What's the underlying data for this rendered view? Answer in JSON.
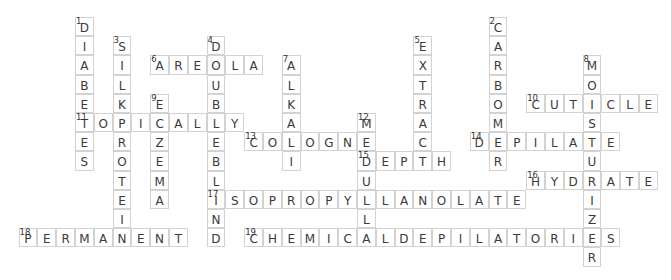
{
  "puzzle": {
    "grid": {
      "origin_x": 75,
      "origin_y": 17,
      "cell_w": 18.8,
      "cell_h": 19.2,
      "line_color": "#d2d2d2",
      "text_color": "#3a3a3a"
    },
    "words": [
      {
        "number": 1,
        "answer": "DIABETES",
        "direction": "down",
        "col": 0,
        "row": 0
      },
      {
        "number": 2,
        "answer": "CARBOMER",
        "direction": "down",
        "col": 22,
        "row": 0
      },
      {
        "number": 3,
        "answer": "SILKPROTEIN",
        "direction": "down",
        "col": 2,
        "row": 1
      },
      {
        "number": 4,
        "answer": "DOUBLEBLIND",
        "direction": "down",
        "col": 7,
        "row": 1
      },
      {
        "number": 5,
        "answer": "EXTRACT",
        "direction": "down",
        "col": 18,
        "row": 1
      },
      {
        "number": 6,
        "answer": "AREOLA",
        "direction": "across",
        "col": 4,
        "row": 2
      },
      {
        "number": 7,
        "answer": "ALKALI",
        "direction": "down",
        "col": 11,
        "row": 2
      },
      {
        "number": 8,
        "answer": "MOISTURIZER",
        "direction": "down",
        "col": 27,
        "row": 2
      },
      {
        "number": 9,
        "answer": "ECZEMA",
        "direction": "down",
        "col": 4,
        "row": 4
      },
      {
        "number": 10,
        "answer": "CUTICLE",
        "direction": "across",
        "col": 24,
        "row": 4
      },
      {
        "number": 11,
        "answer": "TOPICALLY",
        "direction": "across",
        "col": 0,
        "row": 5
      },
      {
        "number": 12,
        "answer": "MEDULLA",
        "direction": "down",
        "col": 15,
        "row": 5
      },
      {
        "number": 13,
        "answer": "COLOGNE",
        "direction": "across",
        "col": 9,
        "row": 6
      },
      {
        "number": 14,
        "answer": "DEPILATE",
        "direction": "across",
        "col": 21,
        "row": 6
      },
      {
        "number": 15,
        "answer": "DEPTH",
        "direction": "across",
        "col": 15,
        "row": 7
      },
      {
        "number": 16,
        "answer": "HYDRATE",
        "direction": "across",
        "col": 24,
        "row": 8
      },
      {
        "number": 17,
        "answer": "ISOPROPYLLANOLATE",
        "direction": "across",
        "col": 7,
        "row": 9
      },
      {
        "number": 18,
        "answer": "PERMANENT",
        "direction": "across",
        "col": -3,
        "row": 11
      },
      {
        "number": 19,
        "answer": "CHEMICALDEPILATORIES",
        "direction": "across",
        "col": 9,
        "row": 11
      }
    ]
  }
}
